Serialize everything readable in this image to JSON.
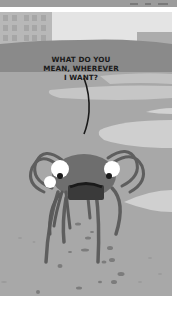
{
  "comic": {
    "panel_count": 1,
    "style": "grayscale",
    "speech_bubble": {
      "lines": [
        "WHAT DO YOU",
        "MEAN, WHEREVER",
        "I WANT?"
      ]
    },
    "scene": {
      "setting": "beach with buildings in background",
      "character": "crab-like creature with long legs and large eyes"
    },
    "colors": {
      "sky": "#e4e4e4",
      "buildings": "#b8b8b8",
      "hill": "#8a8a8a",
      "sand": "#a8a8a8",
      "water_light": "#cfcfcf",
      "creature_body": "#6e6e6e",
      "creature_dark": "#3a3a3a",
      "eye_white": "#ffffff",
      "outline": "#1a1a1a"
    }
  }
}
